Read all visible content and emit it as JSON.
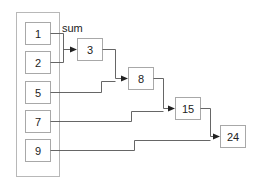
{
  "diagram": {
    "title": "",
    "operation_label": "sum",
    "inputs": [
      {
        "id": "in1",
        "value": "1"
      },
      {
        "id": "in2",
        "value": "2"
      },
      {
        "id": "in3",
        "value": "5"
      },
      {
        "id": "in4",
        "value": "7"
      },
      {
        "id": "in5",
        "value": "9"
      }
    ],
    "accumulators": [
      {
        "id": "acc1",
        "value": "3",
        "from": [
          "in1",
          "in2"
        ]
      },
      {
        "id": "acc2",
        "value": "8",
        "from": [
          "acc1",
          "in3"
        ]
      },
      {
        "id": "acc3",
        "value": "15",
        "from": [
          "acc2",
          "in4"
        ]
      },
      {
        "id": "acc4",
        "value": "24",
        "from": [
          "acc3",
          "in5"
        ]
      }
    ],
    "colors": {
      "box_border": "#a8a8a8",
      "wire": "#555555",
      "text": "#222222"
    }
  }
}
